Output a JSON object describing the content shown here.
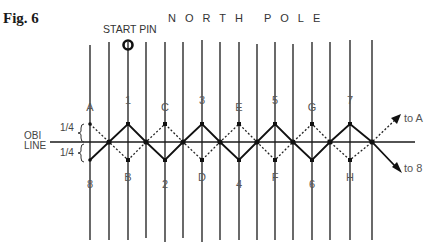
{
  "figure": {
    "label": "Fig. 6",
    "top_caption": "NORTH POLE",
    "start_pin_label": "START PIN"
  },
  "obi_line": {
    "label_line1": "OBI",
    "label_line2": "LINE",
    "upper_fraction": "1/4",
    "lower_fraction": "1/4"
  },
  "upper_labels": [
    "A",
    "1",
    "C",
    "3",
    "E",
    "5",
    "G",
    "7"
  ],
  "lower_labels": [
    "8",
    "B",
    "2",
    "D",
    "4",
    "F",
    "6",
    "H"
  ],
  "arrows": {
    "dotted_end": "to A",
    "solid_end": "to 8"
  },
  "colors": {
    "line": "#1a1a1a",
    "text": "#555555"
  }
}
